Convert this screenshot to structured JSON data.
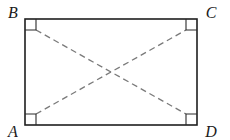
{
  "figure": {
    "kind": "geometry-diagram",
    "background_color": "#ffffff",
    "canvas": {
      "width": 230,
      "height": 140
    }
  },
  "shape": {
    "name": "rectangle",
    "stroke_color": "#1f1f1f",
    "stroke_width": 1.6,
    "fill": "none",
    "bounds": {
      "left": 25,
      "top": 19,
      "right": 197,
      "bottom": 125,
      "width": 172,
      "height": 106
    },
    "corner_points": {
      "top_left": {
        "x": 25,
        "y": 19
      },
      "top_right": {
        "x": 197,
        "y": 19
      },
      "bottom_right": {
        "x": 197,
        "y": 125
      },
      "bottom_left": {
        "x": 25,
        "y": 125
      }
    }
  },
  "vertices": [
    {
      "id": "B",
      "label": "B",
      "x": 25,
      "y": 19,
      "label_x": 13,
      "label_y": 14,
      "position": "top-left"
    },
    {
      "id": "C",
      "label": "C",
      "x": 197,
      "y": 19,
      "label_x": 211,
      "label_y": 14,
      "position": "top-right"
    },
    {
      "id": "D",
      "label": "D",
      "x": 197,
      "y": 125,
      "label_x": 211,
      "label_y": 133,
      "position": "bottom-right"
    },
    {
      "id": "A",
      "label": "A",
      "x": 25,
      "y": 125,
      "label_x": 13,
      "label_y": 133,
      "position": "bottom-left"
    }
  ],
  "diagonals": {
    "stroke_color": "#7a7a7a",
    "stroke_width": 1.3,
    "dash_pattern": "6 4",
    "style": "dashed",
    "segments": [
      {
        "id": "AC",
        "from": "A",
        "to": "C",
        "x1": 36,
        "y1": 114,
        "x2": 186,
        "y2": 30
      },
      {
        "id": "BD",
        "from": "B",
        "to": "D",
        "x1": 36,
        "y1": 30,
        "x2": 186,
        "y2": 114
      }
    ],
    "intersection": {
      "x": 111,
      "y": 72
    }
  },
  "right_angle_marks": {
    "stroke_color": "#2b2b2b",
    "stroke_width": 1.1,
    "size": 11,
    "marks": [
      {
        "at_vertex": "B",
        "x": 25,
        "y": 19,
        "dir_x": 1,
        "dir_y": 1
      },
      {
        "at_vertex": "C",
        "x": 197,
        "y": 19,
        "dir_x": -1,
        "dir_y": 1
      },
      {
        "at_vertex": "D",
        "x": 197,
        "y": 125,
        "dir_x": -1,
        "dir_y": -1
      },
      {
        "at_vertex": "A",
        "x": 25,
        "y": 125,
        "dir_x": 1,
        "dir_y": -1
      }
    ]
  }
}
